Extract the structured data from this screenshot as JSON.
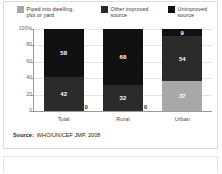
{
  "legend": {
    "items": [
      {
        "label": "Piped into dwelling, plot or yard",
        "color": "#a8a8a8",
        "key": "piped"
      },
      {
        "label": "Other improved source",
        "color": "#2b2b2b",
        "key": "other_improved"
      },
      {
        "label": "Unimproved source",
        "color": "#111111",
        "key": "unimproved"
      }
    ]
  },
  "source": {
    "prefix": "Source:",
    "text": "WHO/UNICEF JMP, 2008"
  },
  "chart_data": {
    "type": "bar",
    "stacked": true,
    "title": "",
    "subtitle": "",
    "xlabel": "",
    "ylabel": "",
    "categories": [
      "Total",
      "Rural",
      "Urban"
    ],
    "ylim": [
      0,
      100
    ],
    "yticks": [
      0,
      20,
      40,
      60,
      80,
      100
    ],
    "ytick_labels": [
      "0",
      "20",
      "40",
      "60",
      "80",
      "100%"
    ],
    "grid": true,
    "legend_position": "top",
    "units": "percent",
    "series": [
      {
        "name": "Piped into dwelling, plot or yard",
        "color": "#a8a8a8",
        "values": [
          0,
          0,
          37
        ]
      },
      {
        "name": "Other improved source",
        "color": "#2b2b2b",
        "values": [
          42,
          32,
          54
        ]
      },
      {
        "name": "Unimproved source",
        "color": "#111111",
        "values": [
          58,
          68,
          9
        ]
      }
    ],
    "data_labels": {
      "Total": {
        "piped": "0",
        "other_improved": "42",
        "unimproved": "58"
      },
      "Rural": {
        "piped": "0",
        "other_improved": "32",
        "unimproved": "68"
      },
      "Urban": {
        "piped": "37",
        "other_improved": "54",
        "unimproved": "9"
      }
    }
  }
}
